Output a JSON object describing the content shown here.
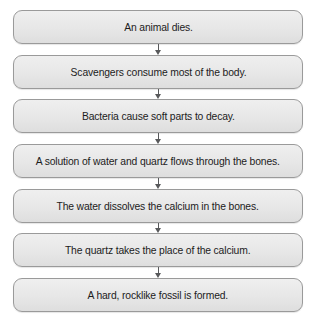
{
  "diagram": {
    "type": "vertical-flowchart",
    "background_color": "#ffffff",
    "box_fill_color": "#e7e7e7",
    "box_border_color": "#9a9a9a",
    "arrow_color": "#58595b",
    "text_color": "#1c1c1c",
    "steps": [
      {
        "label": "An animal dies."
      },
      {
        "label": "Scavengers consume most of the body."
      },
      {
        "label": "Bacteria cause soft parts to decay."
      },
      {
        "label": "A solution of water and quartz flows through the bones."
      },
      {
        "label": "The water dissolves the calcium in the bones."
      },
      {
        "label": "The quartz takes the place of the calcium."
      },
      {
        "label": "A hard, rocklike fossil is formed."
      }
    ]
  }
}
